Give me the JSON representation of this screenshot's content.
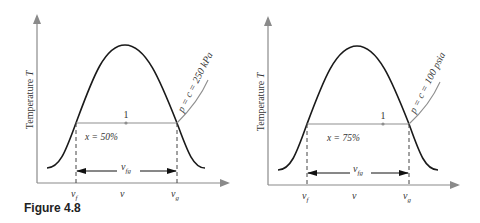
{
  "figure": {
    "caption": "Figure 4.8",
    "colors": {
      "dome": "#1a1a1a",
      "axis": "#8a8a8a",
      "isobar": "#8f8f8f",
      "dash": "#444444",
      "text": "#333333",
      "background": "#ffffff"
    }
  },
  "diagrams": [
    {
      "y_label": "Temperature T",
      "y_label_text": "Temperature ",
      "y_label_var": "T",
      "isobar_label": "p = c = 250 kPa",
      "quality_label": "x = 50%",
      "point_label": "1",
      "x_tick_labels": {
        "vf": "v",
        "vf_sub": "f",
        "v": "v",
        "vg": "v",
        "vg_sub": "g"
      },
      "span_label": "v",
      "span_sub": "fg"
    },
    {
      "y_label": "Temperature T",
      "y_label_text": "Temperature ",
      "y_label_var": "T",
      "isobar_label": "p = c = 100 psia",
      "quality_label": "x = 75%",
      "point_label": "1",
      "x_tick_labels": {
        "vf": "v",
        "vf_sub": "f",
        "v": "v",
        "vg": "v",
        "vg_sub": "g"
      },
      "span_label": "v",
      "span_sub": "fg"
    }
  ]
}
